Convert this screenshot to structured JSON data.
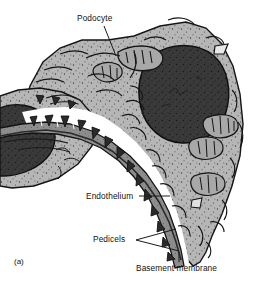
{
  "figure": {
    "caption_label": "(a)",
    "labels": [
      {
        "id": "podocyte",
        "text": "Podocyte",
        "name": "label-podocyte"
      },
      {
        "id": "endothelium",
        "text": "Endothelium",
        "name": "label-endothelium"
      },
      {
        "id": "pedicels",
        "text": "Pedicels",
        "name": "label-pedicels"
      },
      {
        "id": "basement",
        "text": "Basement membrane",
        "name": "label-basement-membrane"
      }
    ],
    "structures": [
      {
        "id": "nucleus-right",
        "name": "podocyte-nucleus-large"
      },
      {
        "id": "nucleus-left",
        "name": "podocyte-nucleus-small"
      },
      {
        "id": "cytoplasm",
        "name": "podocyte-cytoplasm"
      },
      {
        "id": "mitochondria",
        "name": "mitochondria"
      },
      {
        "id": "pedicels",
        "name": "pedicel-foot-processes"
      },
      {
        "id": "gbm",
        "name": "basement-membrane-band"
      },
      {
        "id": "endothelium",
        "name": "endothelium-band"
      },
      {
        "id": "capillary",
        "name": "capillary-lumen-space"
      }
    ],
    "colors": {
      "background": "#ffffff",
      "cytoplasm": "#b4b4b4",
      "nucleus": "#3a3a3a",
      "pedicel": "#2e2e2e",
      "membrane": "#8c8c8c",
      "endothelium": "#6e6e6e",
      "outline": "#141414",
      "lumen": "#ffffff",
      "text": "#111111"
    }
  }
}
